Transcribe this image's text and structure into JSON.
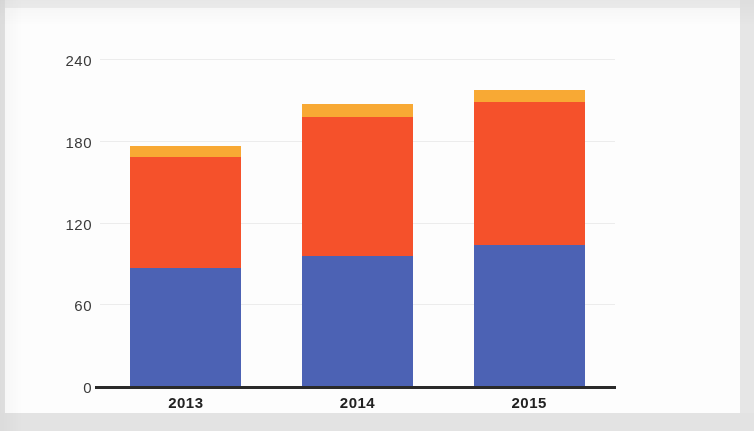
{
  "chart_data": {
    "type": "bar",
    "stacked": true,
    "title": "",
    "subtitle": "",
    "xlabel": "",
    "ylabel": "",
    "categories": [
      "2013",
      "2014",
      "2015"
    ],
    "series": [
      {
        "name": "series-1",
        "color": "#4c62b4",
        "values": [
          87,
          96,
          104
        ]
      },
      {
        "name": "series-2",
        "color": "#f5512b",
        "values": [
          82,
          102,
          105
        ]
      },
      {
        "name": "series-3",
        "color": "#f8a934",
        "values": [
          8,
          10,
          9
        ]
      }
    ],
    "totals": [
      177,
      208,
      218
    ],
    "yticks": [
      0,
      60,
      120,
      180,
      240
    ],
    "ylim": [
      0,
      240
    ],
    "grid": true,
    "legend": "none",
    "axis_line_color": "#2a2a2a",
    "gridline_color": "#ececec",
    "background": "#fdfdfd"
  },
  "axis": {
    "y_tick_labels": [
      "240",
      "180",
      "120",
      "60",
      "0"
    ],
    "x_tick_labels": [
      "2013",
      "2014",
      "2015"
    ]
  },
  "colors": {
    "blue": "#4c62b4",
    "red": "#f5512b",
    "orange": "#f8a934",
    "paper": "#fdfdfd",
    "page_backdrop": "#e9e9e9"
  }
}
